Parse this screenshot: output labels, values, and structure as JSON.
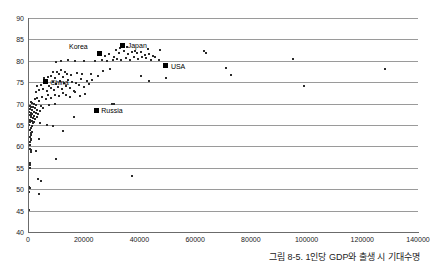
{
  "caption": "그림 8-5. 1인당 GDP와 출생 시 기대수명",
  "chart_data": {
    "type": "scatter",
    "title": "",
    "xlabel": "",
    "ylabel": "",
    "xlim": [
      0,
      140000
    ],
    "ylim": [
      40,
      90
    ],
    "xticks": [
      0,
      20000,
      40000,
      60000,
      80000,
      100000,
      120000,
      140000
    ],
    "yticks": [
      40,
      45,
      50,
      55,
      60,
      65,
      70,
      75,
      80,
      85,
      90
    ],
    "grid": "horizontal",
    "legend": "none",
    "marker_color": "#2b2b2b",
    "highlight_color": "#000000",
    "gridline_color": "#9a9a9a",
    "axis_color": "#6b6b6b",
    "annotations": [
      {
        "label": "Korea",
        "x": 25500,
        "y": 81.7,
        "label_side": "left"
      },
      {
        "label": "Japan",
        "x": 34000,
        "y": 83.6,
        "label_side": "right"
      },
      {
        "label": "USA",
        "x": 49500,
        "y": 78.8,
        "label_side": "right"
      },
      {
        "label": "China",
        "x": 6200,
        "y": 75.1,
        "label_side": "right"
      },
      {
        "label": "Russia",
        "x": 24500,
        "y": 68.4,
        "label_side": "right"
      }
    ],
    "points": [
      [
        300,
        45.2
      ],
      [
        400,
        49.3
      ],
      [
        500,
        50.4
      ],
      [
        600,
        50.3
      ],
      [
        700,
        54.9
      ],
      [
        800,
        55.6
      ],
      [
        700,
        56.1
      ],
      [
        900,
        58.8
      ],
      [
        1000,
        59.2
      ],
      [
        700,
        59.4
      ],
      [
        600,
        60.4
      ],
      [
        800,
        61.0
      ],
      [
        900,
        61.4
      ],
      [
        1100,
        61.7
      ],
      [
        700,
        62.2
      ],
      [
        1200,
        62.6
      ],
      [
        900,
        63.2
      ],
      [
        1500,
        63.4
      ],
      [
        700,
        63.9
      ],
      [
        1000,
        64.4
      ],
      [
        1300,
        64.8
      ],
      [
        500,
        65.1
      ],
      [
        1700,
        65.4
      ],
      [
        800,
        65.6
      ],
      [
        2100,
        65.8
      ],
      [
        1400,
        66.0
      ],
      [
        600,
        66.2
      ],
      [
        2600,
        66.4
      ],
      [
        1900,
        66.6
      ],
      [
        900,
        66.8
      ],
      [
        3100,
        66.9
      ],
      [
        1200,
        67.0
      ],
      [
        2300,
        67.2
      ],
      [
        700,
        67.3
      ],
      [
        1600,
        67.5
      ],
      [
        3600,
        67.6
      ],
      [
        1000,
        67.7
      ],
      [
        2800,
        67.9
      ],
      [
        500,
        68.0
      ],
      [
        2000,
        68.1
      ],
      [
        4200,
        68.3
      ],
      [
        1400,
        68.5
      ],
      [
        3300,
        68.6
      ],
      [
        800,
        68.7
      ],
      [
        2500,
        68.9
      ],
      [
        5500,
        69.0
      ],
      [
        1100,
        69.1
      ],
      [
        1800,
        69.3
      ],
      [
        4800,
        69.4
      ],
      [
        600,
        69.5
      ],
      [
        3000,
        69.6
      ],
      [
        7600,
        69.7
      ],
      [
        2200,
        69.9
      ],
      [
        1300,
        70.1
      ],
      [
        9800,
        69.9
      ],
      [
        900,
        70.3
      ],
      [
        4000,
        70.5
      ],
      [
        16500,
        66.8
      ],
      [
        12500,
        63.6
      ],
      [
        9000,
        64.8
      ],
      [
        6800,
        65.0
      ],
      [
        4400,
        65.4
      ],
      [
        3800,
        61.8
      ],
      [
        2900,
        59.0
      ],
      [
        10200,
        57.1
      ],
      [
        3500,
        52.3
      ],
      [
        4600,
        51.8
      ],
      [
        3900,
        48.8
      ],
      [
        37500,
        53.1
      ],
      [
        2400,
        71.0
      ],
      [
        3400,
        71.3
      ],
      [
        5100,
        71.6
      ],
      [
        6300,
        71.1
      ],
      [
        7200,
        71.9
      ],
      [
        8400,
        71.4
      ],
      [
        9600,
        72.1
      ],
      [
        11000,
        71.7
      ],
      [
        12400,
        72.4
      ],
      [
        13800,
        72.0
      ],
      [
        15200,
        71.5
      ],
      [
        16800,
        72.6
      ],
      [
        18600,
        71.8
      ],
      [
        20500,
        72.3
      ],
      [
        2700,
        72.8
      ],
      [
        4100,
        73.1
      ],
      [
        5400,
        73.4
      ],
      [
        6700,
        72.9
      ],
      [
        8100,
        73.6
      ],
      [
        9400,
        73.2
      ],
      [
        10800,
        73.9
      ],
      [
        12200,
        73.4
      ],
      [
        13600,
        74.1
      ],
      [
        15000,
        73.7
      ],
      [
        16400,
        73.0
      ],
      [
        18200,
        74.3
      ],
      [
        20000,
        73.8
      ],
      [
        22000,
        74.6
      ],
      [
        3200,
        74.0
      ],
      [
        4700,
        74.4
      ],
      [
        6100,
        74.8
      ],
      [
        7400,
        74.2
      ],
      [
        8800,
        75.0
      ],
      [
        10100,
        74.6
      ],
      [
        11500,
        75.3
      ],
      [
        12900,
        74.9
      ],
      [
        14300,
        75.5
      ],
      [
        15700,
        75.1
      ],
      [
        17100,
        74.7
      ],
      [
        19000,
        75.8
      ],
      [
        21000,
        75.2
      ],
      [
        23000,
        75.6
      ],
      [
        5800,
        75.9
      ],
      [
        7000,
        76.2
      ],
      [
        8300,
        76.5
      ],
      [
        9700,
        76.0
      ],
      [
        11200,
        76.8
      ],
      [
        12600,
        76.3
      ],
      [
        14000,
        77.0
      ],
      [
        15400,
        76.6
      ],
      [
        17500,
        77.2
      ],
      [
        19500,
        76.9
      ],
      [
        9100,
        77.5
      ],
      [
        10500,
        77.3
      ],
      [
        11900,
        77.8
      ],
      [
        13300,
        77.4
      ],
      [
        22500,
        77.0
      ],
      [
        25000,
        76.4
      ],
      [
        27000,
        77.6
      ],
      [
        29500,
        78.1
      ],
      [
        10000,
        79.8
      ],
      [
        12000,
        79.9
      ],
      [
        14500,
        80.1
      ],
      [
        17000,
        79.9
      ],
      [
        20000,
        80.0
      ],
      [
        24000,
        80.0
      ],
      [
        26500,
        80.2
      ],
      [
        28500,
        79.9
      ],
      [
        30500,
        80.3
      ],
      [
        32000,
        80.5
      ],
      [
        33500,
        80.1
      ],
      [
        35000,
        80.7
      ],
      [
        36500,
        80.3
      ],
      [
        38000,
        80.9
      ],
      [
        39500,
        80.4
      ],
      [
        41000,
        81.0
      ],
      [
        42500,
        80.6
      ],
      [
        44000,
        80.2
      ],
      [
        45500,
        80.8
      ],
      [
        47000,
        80.3
      ],
      [
        27500,
        81.2
      ],
      [
        29000,
        81.5
      ],
      [
        30800,
        81.0
      ],
      [
        32500,
        81.8
      ],
      [
        34500,
        82.3
      ],
      [
        36000,
        81.6
      ],
      [
        37500,
        82.0
      ],
      [
        39000,
        81.9
      ],
      [
        40500,
        82.1
      ],
      [
        42000,
        81.4
      ],
      [
        43500,
        81.7
      ],
      [
        45000,
        81.2
      ],
      [
        31500,
        82.6
      ],
      [
        33000,
        82.9
      ],
      [
        35500,
        83.2
      ],
      [
        38500,
        82.4
      ],
      [
        43000,
        82.8
      ],
      [
        47500,
        82.5
      ],
      [
        31000,
        70.0
      ],
      [
        30000,
        69.9
      ],
      [
        40500,
        76.4
      ],
      [
        43500,
        75.3
      ],
      [
        49500,
        76.0
      ],
      [
        63000,
        82.2
      ],
      [
        64000,
        81.9
      ],
      [
        71000,
        78.4
      ],
      [
        73000,
        76.7
      ],
      [
        95000,
        80.5
      ],
      [
        99000,
        74.0
      ],
      [
        128000,
        78.0
      ]
    ]
  }
}
